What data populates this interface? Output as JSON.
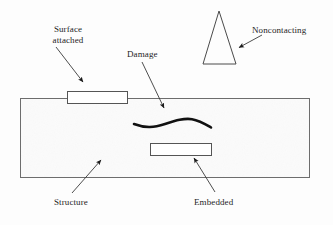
{
  "figure": {
    "type": "schematic-diagram",
    "background_color": "#fdfdfd",
    "line_color": "#4a4a4a",
    "damage_color": "#111111",
    "text_color": "#1d1d1d"
  },
  "labels": {
    "surface_attached": "Surface\nattached",
    "surface_attached_line1": "Surface",
    "surface_attached_line2": "attached",
    "damage": "Damage",
    "noncontacting": "Noncontacting",
    "structure": "Structure",
    "embedded": "Embedded"
  },
  "shapes": {
    "structure": {
      "name": "structure-body",
      "x": 20,
      "y": 98,
      "width": 290,
      "height": 80,
      "fill": "#fcfcfc",
      "stroke": "#6d6d6d"
    },
    "surface_sensor": {
      "name": "surface-attached-sensor",
      "x": 67,
      "y": 91,
      "width": 61,
      "height": 13,
      "fill": "#ffffff",
      "stroke": "#555555"
    },
    "embedded_sensor": {
      "name": "embedded-sensor",
      "x": 150,
      "y": 143,
      "width": 62,
      "height": 13,
      "fill": "#ffffff",
      "stroke": "#555555"
    },
    "noncontacting_transducer": {
      "name": "noncontacting-transducer-triangle",
      "apex_x": 219,
      "apex_y": 11,
      "left_x": 203,
      "left_y": 64,
      "right_x": 236,
      "right_y": 64,
      "fill": "none",
      "stroke": "#4a4a4a"
    },
    "damage_crack": {
      "name": "damage-crack-squiggle",
      "color": "#111111",
      "path": "M 134 124 C 146 128, 154 127, 165 124 C 176 121, 184 118, 192 119 C 199 120, 205 124, 211 127"
    }
  },
  "arrows": [
    {
      "name": "surface-attached-arrow",
      "x1": 56,
      "y1": 47,
      "x2": 83,
      "y2": 82
    },
    {
      "name": "damage-arrow",
      "x1": 142,
      "y1": 62,
      "x2": 164,
      "y2": 108
    },
    {
      "name": "noncontacting-arrow",
      "x1": 262,
      "y1": 35,
      "x2": 238,
      "y2": 48
    },
    {
      "name": "structure-arrow",
      "x1": 72,
      "y1": 193,
      "x2": 101,
      "y2": 160
    },
    {
      "name": "embedded-arrow",
      "x1": 215,
      "y1": 192,
      "x2": 194,
      "y2": 158
    }
  ]
}
